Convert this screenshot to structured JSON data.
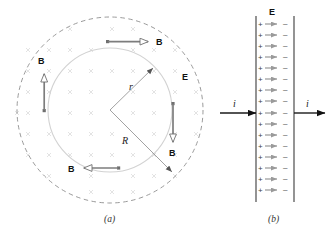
{
  "figure": {
    "panels": [
      {
        "id": "panel-a",
        "caption": "(a)",
        "description_labels": {
          "b_top": "B",
          "b_left": "B",
          "b_right": "B",
          "b_bottom": "B",
          "e_field": "E",
          "radius_r": "r",
          "radius_R": "R"
        },
        "geometry": {
          "center_x": 110,
          "center_y": 110,
          "outer_radius_R": 93,
          "inner_radius_r": 62,
          "outer_style": "dashed",
          "inner_style": "solid"
        },
        "field_marks": {
          "glyph": "x",
          "meaning": "E-field into page",
          "color": "#d8d8d8",
          "rows": 9,
          "cols": 9,
          "spacing": 21
        },
        "b_arrows": [
          {
            "name": "b-arrow-top",
            "direction": "right",
            "x1": 108,
            "y1": 42,
            "x2": 148,
            "y2": 42,
            "label": "B",
            "label_x": 156,
            "label_y": 45
          },
          {
            "name": "b-arrow-left",
            "direction": "up",
            "x1": 44,
            "y1": 110,
            "x2": 44,
            "y2": 74,
            "label": "B",
            "label_x": 41,
            "label_y": 64
          },
          {
            "name": "b-arrow-right",
            "direction": "down",
            "x1": 173,
            "y1": 104,
            "x2": 173,
            "y2": 142,
            "label": "B",
            "label_x": 170,
            "label_y": 155
          },
          {
            "name": "b-arrow-bottom",
            "direction": "left",
            "x1": 118,
            "y1": 168,
            "x2": 84,
            "y2": 168,
            "label": "B",
            "label_x": 71,
            "label_y": 172
          }
        ],
        "radius_lines": [
          {
            "name": "radius-r-line",
            "x1": 110,
            "y1": 110,
            "x2": 155,
            "y2": 66,
            "label": "r",
            "label_x": 131,
            "label_y": 88,
            "arrow": true
          },
          {
            "name": "radius-R-line",
            "x1": 110,
            "y1": 110,
            "x2": 172,
            "y2": 172,
            "label": "R",
            "label_x": 126,
            "label_y": 141,
            "arrow": true
          }
        ],
        "e_label": {
          "text": "E",
          "x": 184,
          "y": 79
        }
      },
      {
        "id": "panel-b",
        "caption": "(b)",
        "description_labels": {
          "e_field": "E",
          "current_left": "i",
          "current_right": "i"
        },
        "geometry": {
          "plate_left_x": 256,
          "plate_right_x": 294,
          "plate_top_y": 16,
          "plate_bottom_y": 202,
          "gap_width": 38
        },
        "charge_rows": 17,
        "charge_positive": "+",
        "charge_negative": "−",
        "e_label": {
          "text": "E",
          "x": 272,
          "y": 15
        },
        "current_arrows": [
          {
            "name": "current-arrow-left",
            "x1": 220,
            "y1": 113,
            "x2": 256,
            "y2": 113,
            "label": "i",
            "label_x": 234,
            "label_y": 105
          },
          {
            "name": "current-arrow-right",
            "x1": 294,
            "y1": 113,
            "x2": 325,
            "y2": 113,
            "label": "i",
            "label_x": 308,
            "label_y": 105
          }
        ]
      }
    ]
  },
  "colors": {
    "ink": "#111111",
    "line_gray": "#808080",
    "field_mark": "#dcdcdc",
    "inner_circle": "#d0d0d0",
    "outer_circle": "#8a8a8a",
    "arrow_body": "#767676",
    "background": "#ffffff"
  }
}
